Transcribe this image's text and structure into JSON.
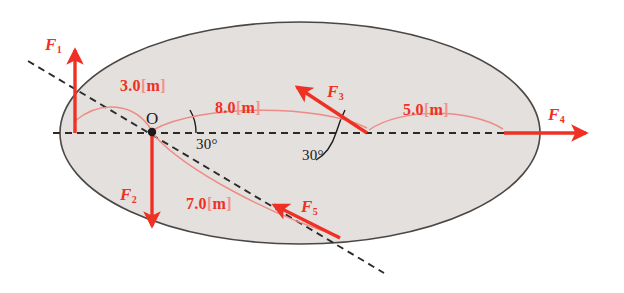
{
  "figure": {
    "colors": {
      "force_red": "#ee3124",
      "dim_red": "#ee3124",
      "bracket_pink": "#f3928c",
      "arc_pink": "#ef8b85",
      "body_fill": "#e3e0dd",
      "body_stroke": "#4a4745",
      "axis_dash": "#2b2b2b",
      "text_black": "#1a1a1a",
      "background": "#ffffff"
    },
    "origin": {
      "label": "O"
    },
    "forces": [
      {
        "name": "F1",
        "label": "F",
        "subscript": "1",
        "direction": "up",
        "tail": [
          75,
          133
        ],
        "head": [
          75,
          48
        ]
      },
      {
        "name": "F2",
        "label": "F",
        "subscript": "2",
        "direction": "down",
        "tail": [
          152,
          133
        ],
        "head": [
          152,
          228
        ]
      },
      {
        "name": "F3",
        "label": "F",
        "subscript": "3",
        "direction": "up-left-30deg",
        "tail": [
          367,
          133
        ],
        "head": [
          295,
          85
        ]
      },
      {
        "name": "F4",
        "label": "F",
        "subscript": "4",
        "direction": "right",
        "tail": [
          504,
          133
        ],
        "head": [
          588,
          133
        ]
      },
      {
        "name": "F5",
        "label": "F",
        "subscript": "5",
        "direction": "up-left-along-diagonal",
        "tail": [
          340,
          238
        ],
        "head": [
          272,
          203
        ]
      }
    ],
    "dimensions": [
      {
        "name": "dim-3m",
        "value": "3.0",
        "open_bracket": "[",
        "unit": "m",
        "close_bracket": "]",
        "from": "O",
        "to": "F1-base"
      },
      {
        "name": "dim-8m",
        "value": "8.0",
        "open_bracket": "[",
        "unit": "m",
        "close_bracket": "]",
        "from": "O",
        "to": "F3-base"
      },
      {
        "name": "dim-5m",
        "value": "5.0",
        "open_bracket": "[",
        "unit": "m",
        "close_bracket": "]",
        "from": "F3-base",
        "to": "F4-base"
      },
      {
        "name": "dim-7m",
        "value": "7.0",
        "open_bracket": "[",
        "unit": "m",
        "close_bracket": "]",
        "from": "O",
        "to": "F5-base"
      }
    ],
    "angles": [
      {
        "name": "angle-at-origin",
        "text": "30°",
        "between": "horizontal-axis and diagonal-dashed-line"
      },
      {
        "name": "angle-at-f3-base",
        "text": "30°",
        "between": "horizontal-axis and F3"
      }
    ]
  }
}
